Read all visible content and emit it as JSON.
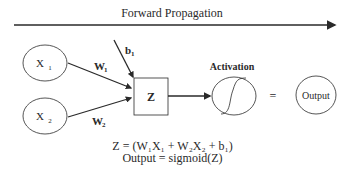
{
  "title": "Forward Propagation",
  "inputs": [
    {
      "label": "X",
      "sub": "1",
      "weight": "W",
      "weight_sub": "1"
    },
    {
      "label": "X",
      "sub": "2",
      "weight": "W",
      "weight_sub": "2"
    }
  ],
  "bias": {
    "label": "b",
    "sub": "1"
  },
  "sum_node": {
    "label": "Z"
  },
  "activation": {
    "label": "Activation",
    "icon": "sigmoid-curve"
  },
  "equals": "=",
  "output": {
    "label": "Output"
  },
  "equations": {
    "line1": "Z = (W₁X₁ + W₂X₂ + b₁)",
    "line2": "Output = sigmoid(Z)"
  },
  "colors": {
    "stroke": "#2a2a2a",
    "background": "#ffffff"
  }
}
